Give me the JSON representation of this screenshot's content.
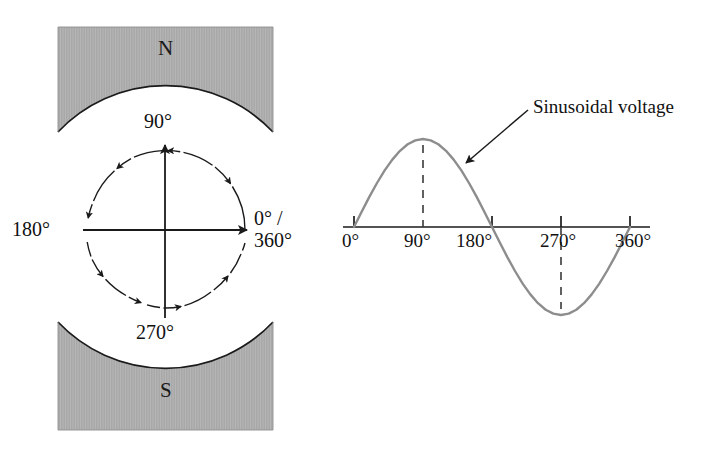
{
  "figure": {
    "background_color": "#ffffff"
  },
  "magnet": {
    "north_pole_label": "N",
    "south_pole_label": "S",
    "fill_color": "#a8a8a8",
    "edge_color": "#1a1a1a"
  },
  "rotation_diagram": {
    "name": "angular-position-circle",
    "labels": {
      "top": "90°",
      "left": "180°",
      "bottom": "270°",
      "right_line1": "0° /",
      "right_line2": "360°"
    },
    "rotation_direction": "counterclockwise",
    "circle_style": "dashed-with-arrowheads",
    "axis_color": "#1a1a1a"
  },
  "waveform": {
    "annotation": "Sinusoidal voltage",
    "curve_color": "#8d8d8d",
    "axis_color": "#1a1a1a",
    "tick_labels": [
      "0°",
      "90°",
      "180°",
      "270°",
      "360°"
    ]
  },
  "chart_data": {
    "type": "line",
    "title": "",
    "subtitle": "",
    "xlabel": "",
    "ylabel": "",
    "annotations": [
      {
        "text": "Sinusoidal voltage",
        "points_to_x": 150,
        "points_to_y": 0.72
      }
    ],
    "legend": [],
    "grid": false,
    "xlim": [
      -12,
      372
    ],
    "ylim": [
      -1.08,
      1.08
    ],
    "xticks": [
      0,
      90,
      180,
      270,
      360
    ],
    "xticklabels": [
      "0°",
      "90°",
      "180°",
      "270°",
      "360°"
    ],
    "yticks": [],
    "series": [
      {
        "name": "Sinusoidal voltage",
        "color": "#8d8d8d",
        "x": [
          0,
          10,
          20,
          30,
          40,
          50,
          60,
          70,
          80,
          90,
          100,
          110,
          120,
          130,
          140,
          150,
          160,
          170,
          180,
          190,
          200,
          210,
          220,
          230,
          240,
          250,
          260,
          270,
          280,
          290,
          300,
          310,
          320,
          330,
          340,
          350,
          360
        ],
        "values": [
          0,
          0.174,
          0.342,
          0.5,
          0.643,
          0.766,
          0.866,
          0.94,
          0.985,
          1.0,
          0.985,
          0.94,
          0.866,
          0.766,
          0.643,
          0.5,
          0.342,
          0.174,
          0,
          -0.174,
          -0.342,
          -0.5,
          -0.643,
          -0.766,
          -0.866,
          -0.94,
          -0.985,
          -1.0,
          -0.985,
          -0.94,
          -0.866,
          -0.766,
          -0.643,
          -0.5,
          -0.342,
          -0.174,
          0
        ]
      }
    ],
    "markers": [
      {
        "x": 90,
        "label": "peak",
        "value": 1.0,
        "style": "dashed-vertical"
      },
      {
        "x": 270,
        "label": "trough",
        "value": -1.0,
        "style": "dashed-vertical"
      }
    ]
  }
}
